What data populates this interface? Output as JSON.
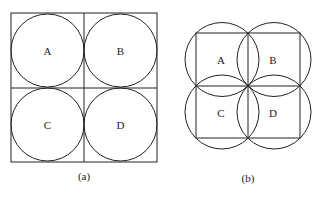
{
  "figure_a": {
    "caption": "(a)",
    "labels": [
      "A",
      "B",
      "C",
      "D"
    ]
  },
  "figure_b": {
    "caption": "(b)",
    "labels": [
      "A",
      "B",
      "C",
      "D"
    ]
  },
  "colors": {
    "stroke": "#222222",
    "background": "#ffffff"
  }
}
